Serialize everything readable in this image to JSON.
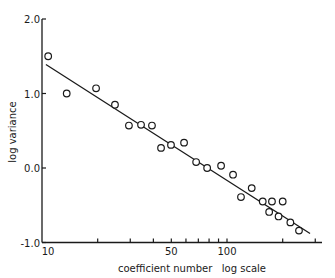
{
  "chart_data": {
    "type": "scatter",
    "title": "",
    "xlabel": "coefficient number   log scale",
    "ylabel": "log variance",
    "x_scale": "log",
    "xlim": [
      10,
      330
    ],
    "ylim": [
      -1.0,
      2.0
    ],
    "grid": false,
    "legend": null,
    "x_ticks": [
      {
        "value": 10,
        "label": "10"
      },
      {
        "value": 20,
        "label": ""
      },
      {
        "value": 30,
        "label": ""
      },
      {
        "value": 40,
        "label": ""
      },
      {
        "value": 50,
        "label": "50"
      },
      {
        "value": 60,
        "label": ""
      },
      {
        "value": 70,
        "label": ""
      },
      {
        "value": 80,
        "label": ""
      },
      {
        "value": 90,
        "label": ""
      },
      {
        "value": 100,
        "label": "100"
      },
      {
        "value": 200,
        "label": ""
      },
      {
        "value": 300,
        "label": ""
      }
    ],
    "y_ticks": [
      {
        "value": 2.0,
        "label": "2.0"
      },
      {
        "value": 1.0,
        "label": "1.0"
      },
      {
        "value": 0.0,
        "label": "0.0"
      },
      {
        "value": -1.0,
        "label": "-1.0"
      }
    ],
    "series": [
      {
        "name": "observed",
        "marker": "open-circle",
        "points": [
          [
            10.8,
            1.5
          ],
          [
            13.6,
            1.0
          ],
          [
            19.6,
            1.07
          ],
          [
            24.8,
            0.85
          ],
          [
            29.5,
            0.57
          ],
          [
            34.3,
            0.58
          ],
          [
            39.3,
            0.57
          ],
          [
            44.0,
            0.27
          ],
          [
            49.8,
            0.31
          ],
          [
            58.6,
            0.34
          ],
          [
            68.1,
            0.08
          ],
          [
            78.1,
            0.0
          ],
          [
            92.9,
            0.03
          ],
          [
            107.8,
            -0.09
          ],
          [
            119,
            -0.39
          ],
          [
            136,
            -0.27
          ],
          [
            156,
            -0.45
          ],
          [
            175,
            -0.45
          ],
          [
            200,
            -0.45
          ],
          [
            169,
            -0.59
          ],
          [
            190,
            -0.65
          ],
          [
            220,
            -0.73
          ],
          [
            245,
            -0.84
          ]
        ]
      },
      {
        "name": "fitted line",
        "style": "line",
        "points": [
          [
            10.5,
            1.39
          ],
          [
            281,
            -0.88
          ]
        ]
      }
    ]
  }
}
